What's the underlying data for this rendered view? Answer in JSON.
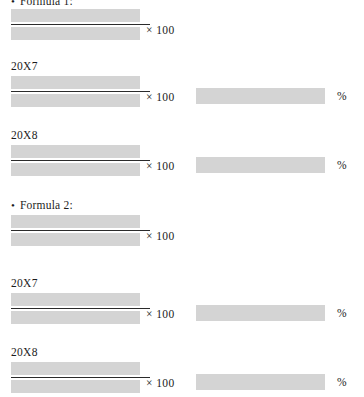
{
  "document": {
    "multiplier_label": "× 100",
    "percent_label": "%",
    "sections": [
      {
        "heading": "• Formula 1:",
        "heading_bullet": "•",
        "heading_text": "Formula 1:",
        "blocks": [
          {
            "label": "",
            "has_label": false,
            "multiplier": "× 100",
            "has_result": false,
            "percent": ""
          },
          {
            "label": "20X7",
            "has_label": true,
            "multiplier": "× 100",
            "has_result": true,
            "percent": "%"
          },
          {
            "label": "20X8",
            "has_label": true,
            "multiplier": "× 100",
            "has_result": true,
            "percent": "%"
          }
        ]
      },
      {
        "heading": "• Formula 2:",
        "heading_bullet": "•",
        "heading_text": "Formula 2:",
        "blocks": [
          {
            "label": "",
            "has_label": false,
            "multiplier": "× 100",
            "has_result": false,
            "percent": ""
          },
          {
            "label": "20X7",
            "has_label": true,
            "multiplier": "× 100",
            "has_result": true,
            "percent": "%"
          },
          {
            "label": "20X8",
            "has_label": true,
            "multiplier": "× 100",
            "has_result": true,
            "percent": "%"
          }
        ]
      }
    ],
    "colors": {
      "redaction_gray": "#d4d4d4",
      "rule_dark": "#2b2b2b",
      "text": "#1c1c1c",
      "background": "#ffffff"
    }
  }
}
